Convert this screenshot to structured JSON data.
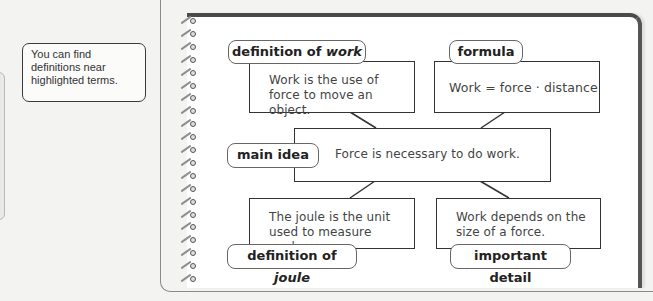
{
  "sidebar": {
    "callout_text": "You can find definitions near highlighted terms."
  },
  "diagram": {
    "definition_work": {
      "label_prefix": "definition of ",
      "label_term": "work",
      "text": "Work is the use of force to move an object."
    },
    "formula": {
      "label": "formula",
      "text": "Work = force · distance"
    },
    "main_idea": {
      "label": "main idea",
      "text": "Force is necessary to do work."
    },
    "definition_joule": {
      "label_prefix": "definition of ",
      "label_term": "joule",
      "text": "The joule is the unit used to measure work."
    },
    "important_detail": {
      "label": "important detail",
      "text": "Work depends on the size of a force."
    }
  },
  "colors": {
    "background": "#f3f3f2",
    "notebook_border": "#4a4a4a",
    "box_border": "#333333"
  }
}
